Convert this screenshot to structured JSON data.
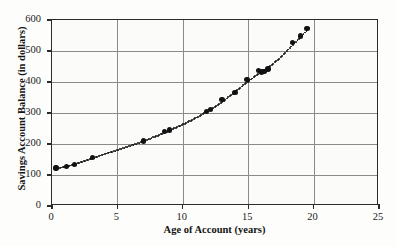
{
  "chart_data": {
    "type": "scatter",
    "title": "",
    "xlabel": "Age of Account (years)",
    "ylabel": "Savings Account Balance (in dollars)",
    "xlim": [
      0,
      25
    ],
    "ylim": [
      0,
      600
    ],
    "xticks": [
      0,
      5,
      10,
      15,
      20,
      25
    ],
    "yticks": [
      0,
      100,
      200,
      300,
      400,
      500,
      600
    ],
    "grid": true,
    "legend": "none",
    "series": [
      {
        "name": "Savings Account Balance",
        "marker": "filled-circle",
        "color": "#111111",
        "points": [
          [
            0.3,
            122
          ],
          [
            1.1,
            128
          ],
          [
            1.7,
            134
          ],
          [
            3.1,
            157
          ],
          [
            7.0,
            210
          ],
          [
            8.6,
            240
          ],
          [
            9.0,
            245
          ],
          [
            11.8,
            304
          ],
          [
            12.1,
            312
          ],
          [
            13.0,
            344
          ],
          [
            14.0,
            366
          ],
          [
            14.9,
            409
          ],
          [
            15.8,
            437
          ],
          [
            16.0,
            432
          ],
          [
            16.2,
            433
          ],
          [
            16.5,
            442
          ],
          [
            18.4,
            527
          ],
          [
            19.0,
            548
          ],
          [
            19.5,
            572
          ]
        ]
      }
    ],
    "trend": {
      "name": "dotted fitted curve",
      "style": "dotted",
      "color": "#111111",
      "description": "exponential growth curve through the data points"
    }
  },
  "axis": {
    "x_tick_labels": [
      "0",
      "5",
      "10",
      "15",
      "20",
      "25"
    ],
    "y_tick_labels": [
      "0",
      "100",
      "200",
      "300",
      "400",
      "500",
      "600"
    ]
  },
  "colors": {
    "marker": "#111111",
    "grid": "#8a8a8a",
    "frame": "#2b2b2b",
    "background": "#fdfdfb"
  }
}
